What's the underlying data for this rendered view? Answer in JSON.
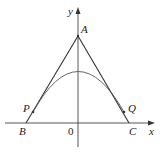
{
  "diagram": {
    "colors": {
      "line": "#333333",
      "curve": "#555555",
      "background": "#ffffff"
    },
    "axes": {
      "x_label": "x",
      "y_label": "y",
      "origin_label": "0"
    },
    "points": {
      "A": {
        "label": "A"
      },
      "B": {
        "label": "B"
      },
      "C": {
        "label": "C"
      },
      "P": {
        "label": "P"
      },
      "Q": {
        "label": "Q"
      }
    }
  }
}
